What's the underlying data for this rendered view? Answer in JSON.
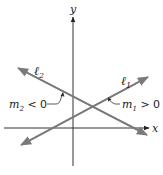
{
  "diagram": {
    "title": "",
    "axes": {
      "x_label": "x",
      "y_label": "y"
    },
    "lines": [
      {
        "id": "l1",
        "label_main": "ℓ",
        "label_sub": "1",
        "slope_label_var": "m",
        "slope_label_sub": "1",
        "slope_label_rel": " > 0",
        "slope_sign": "positive"
      },
      {
        "id": "l2",
        "label_main": "ℓ",
        "label_sub": "2",
        "slope_label_var": "m",
        "slope_label_sub": "2",
        "slope_label_rel": " < 0",
        "slope_sign": "negative"
      }
    ],
    "colors": {
      "axis": "#333333",
      "line": "#7a7a7a",
      "text": "#222222",
      "background": "#ffffff"
    }
  }
}
